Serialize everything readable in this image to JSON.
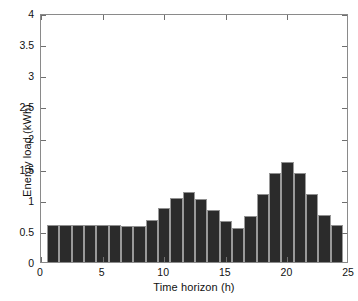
{
  "chart_data": {
    "type": "bar",
    "title": "",
    "xlabel": "Time horizon (h)",
    "ylabel": "Energy load (kWh)",
    "xlim": [
      0,
      25
    ],
    "ylim": [
      0,
      4
    ],
    "grid": false,
    "legend": null,
    "bar_color": "#2b2b2b",
    "bar_edge_color": "#9a9a9a",
    "axes_color": "#8a8a8a",
    "background_color": "#ffffff",
    "xticks": [
      0,
      5,
      10,
      15,
      20,
      25
    ],
    "xtick_labels": [
      "0",
      "5",
      "10",
      "15",
      "20",
      "25"
    ],
    "yticks": [
      0,
      0.5,
      1,
      1.5,
      2,
      2.5,
      3,
      3.5,
      4
    ],
    "ytick_labels": [
      "0",
      "0.5",
      "1",
      "1.5",
      "2",
      "2.5",
      "3",
      "3.5",
      "4"
    ],
    "categories": [
      1,
      2,
      3,
      4,
      5,
      6,
      7,
      8,
      9,
      10,
      11,
      12,
      13,
      14,
      15,
      16,
      17,
      18,
      19,
      20,
      21,
      22,
      23,
      24
    ],
    "values": [
      0.59,
      0.59,
      0.59,
      0.59,
      0.59,
      0.6,
      0.58,
      0.58,
      0.67,
      0.86,
      1.03,
      1.12,
      1.02,
      0.83,
      0.66,
      0.55,
      0.74,
      1.09,
      1.43,
      1.6,
      1.43,
      1.09,
      0.76,
      0.6
    ]
  }
}
